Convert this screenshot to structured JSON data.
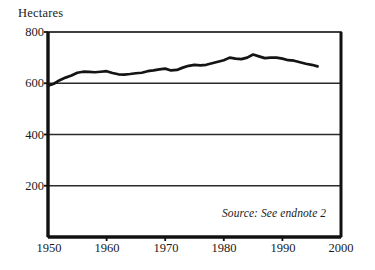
{
  "chart_data": {
    "type": "line",
    "title": "",
    "ylabel": "Hectares",
    "xlabel": "",
    "xlim": [
      1950,
      2000
    ],
    "ylim": [
      0,
      800
    ],
    "grid": true,
    "legend_position": "none",
    "yticks": [
      800,
      600,
      400,
      200
    ],
    "xticks": [
      1950,
      1960,
      1970,
      1980,
      1990,
      2000
    ],
    "annotations": [
      {
        "text": "Source: See endnote 2",
        "x": 1988,
        "y": 110,
        "style": "italic"
      }
    ],
    "series": [
      {
        "name": "Grainland per capita",
        "x": [
          1950,
          1951,
          1952,
          1953,
          1954,
          1955,
          1956,
          1957,
          1958,
          1959,
          1960,
          1961,
          1962,
          1963,
          1964,
          1965,
          1966,
          1967,
          1968,
          1969,
          1970,
          1971,
          1972,
          1973,
          1974,
          1975,
          1976,
          1977,
          1978,
          1979,
          1980,
          1981,
          1982,
          1983,
          1984,
          1985,
          1986,
          1987,
          1988,
          1989,
          1990,
          1991,
          1992,
          1993,
          1994,
          1995,
          1996
        ],
        "values": [
          590,
          598,
          612,
          622,
          630,
          641,
          645,
          644,
          643,
          645,
          647,
          640,
          635,
          634,
          636,
          639,
          641,
          647,
          650,
          654,
          657,
          650,
          652,
          661,
          668,
          672,
          670,
          672,
          678,
          684,
          690,
          700,
          696,
          694,
          700,
          712,
          705,
          698,
          700,
          700,
          696,
          690,
          688,
          682,
          676,
          672,
          666
        ]
      }
    ]
  },
  "labels": {
    "ylabel": "Hectares",
    "ytick_800": "800",
    "ytick_600": "600",
    "ytick_400": "400",
    "ytick_200": "200",
    "xtick_1950": "1950",
    "xtick_1960": "1960",
    "xtick_1970": "1970",
    "xtick_1980": "1980",
    "xtick_1990": "1990",
    "xtick_2000": "2000",
    "source_note": "Source: See endnote 2"
  },
  "colors": {
    "line": "#141414",
    "axis": "#111111",
    "grid": "#2b2b2b",
    "background": "#ffffff",
    "text": "#1a1a1a"
  }
}
